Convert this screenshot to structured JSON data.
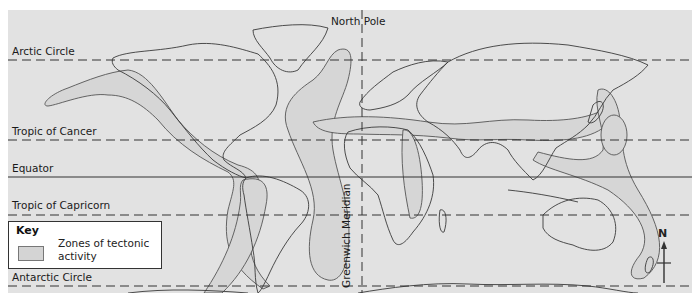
{
  "map": {
    "title": "World map of tectonic activity zones",
    "latitude_lines": [
      {
        "name": "Arctic Circle",
        "style": "dashed"
      },
      {
        "name": "Tropic of Cancer",
        "style": "dashed"
      },
      {
        "name": "Equator",
        "style": "solid"
      },
      {
        "name": "Tropic of Capricorn",
        "style": "dashed"
      },
      {
        "name": "Antarctic Circle",
        "style": "dashed"
      }
    ],
    "north_pole_label": "North Pole",
    "meridian_label": "Greenwich Meridian",
    "compass_label": "N",
    "colors": {
      "background": "#e2e2e2",
      "tectonic_zone_fill": "#d4d4d4",
      "line": "#333333"
    }
  },
  "key": {
    "title": "Key",
    "items": [
      {
        "label": "Zones of tectonic activity",
        "line1": "Zones of tectonic",
        "line2": "activity"
      }
    ]
  }
}
